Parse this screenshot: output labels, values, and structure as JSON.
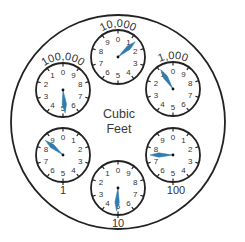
{
  "title": "Cubic Feet",
  "center_label": {
    "line1": "Cubic",
    "line2": "Feet"
  },
  "colors": {
    "needle": "#2f7db0",
    "outline": "#222222",
    "text": "#333333"
  },
  "outer_circle": {
    "cx": 118,
    "cy": 122,
    "r": 107
  },
  "dials": [
    {
      "label": "10,000",
      "cx": 118,
      "cy": 57,
      "r": 27,
      "direction": "clockwise",
      "needle_value": 1.35,
      "label_pos": "top",
      "reading": 1
    },
    {
      "label": "100,000",
      "cx": 63,
      "cy": 90,
      "r": 27,
      "direction": "counterclockwise",
      "needle_value": 5.15,
      "label_pos": "top",
      "reading": 5
    },
    {
      "label": "1,000",
      "cx": 173,
      "cy": 89,
      "r": 27,
      "direction": "counterclockwise",
      "needle_value": 0.9,
      "label_pos": "top",
      "reading": 0
    },
    {
      "label": "1",
      "cx": 63,
      "cy": 155,
      "r": 27,
      "direction": "clockwise",
      "needle_value": 8.6,
      "label_pos": "bottom",
      "reading": 8
    },
    {
      "label": "100",
      "cx": 173,
      "cy": 155,
      "r": 27,
      "direction": "clockwise",
      "needle_value": 7.5,
      "label_pos": "bottom",
      "reading": 7
    },
    {
      "label": "10",
      "cx": 118,
      "cy": 188,
      "r": 27,
      "direction": "counterclockwise",
      "needle_value": 4.9,
      "label_pos": "bottom",
      "reading": 4
    }
  ],
  "digits": [
    "0",
    "1",
    "2",
    "3",
    "4",
    "5",
    "6",
    "7",
    "8",
    "9"
  ]
}
